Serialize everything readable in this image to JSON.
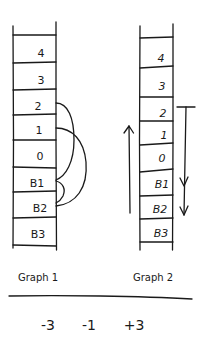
{
  "graphs": [
    {
      "caption": "Graph 1",
      "floors": [
        "4",
        "3",
        "2",
        "1",
        "0",
        "B1",
        "B2",
        "B3"
      ],
      "connections": [
        {
          "from": "2",
          "to": "B1"
        },
        {
          "from": "1",
          "to": "B2"
        },
        {
          "from": "B1",
          "to": "B2"
        }
      ]
    },
    {
      "caption": "Graph 2",
      "floors": [
        "4",
        "3",
        "2",
        "1",
        "0",
        "B1",
        "B2",
        "B3"
      ],
      "arrows": [
        {
          "direction": "up",
          "label": "up-arrow",
          "from": "B2",
          "to": "1"
        },
        {
          "direction": "down",
          "label": "down-arrow",
          "from": "2",
          "to": "B2"
        }
      ]
    }
  ],
  "results": [
    "-3",
    "-1",
    "+3"
  ]
}
